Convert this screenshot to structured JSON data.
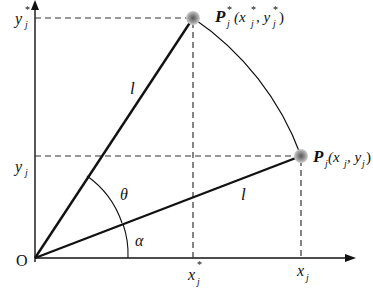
{
  "diagram": {
    "type": "geometry-rotation",
    "origin_label": "O",
    "segment_label": "l",
    "angles": {
      "theta": "θ",
      "alpha": "α"
    },
    "points": {
      "original": {
        "name": "P",
        "sub": "j",
        "coords_text": "(x",
        "x_sub": "j",
        "sep": ", y",
        "y_sub": "j",
        "close": ")"
      },
      "rotated": {
        "name": "P",
        "sub": "j",
        "sup": "*",
        "coords_open": "(x",
        "x_sub": "j",
        "x_sup": "*",
        "sep": ", y",
        "y_sub": "j",
        "y_sup": "*",
        "close": ")"
      }
    },
    "axis_labels": {
      "y_star": {
        "base": "y",
        "sub": "j",
        "sup": "*"
      },
      "y": {
        "base": "y",
        "sub": "j"
      },
      "x_star": {
        "base": "x",
        "sub": "j",
        "sup": "*"
      },
      "x": {
        "base": "x",
        "sub": "j"
      }
    },
    "colors": {
      "line": "#111111",
      "dash": "#333333",
      "point_halo": "#9a9a9a"
    }
  }
}
